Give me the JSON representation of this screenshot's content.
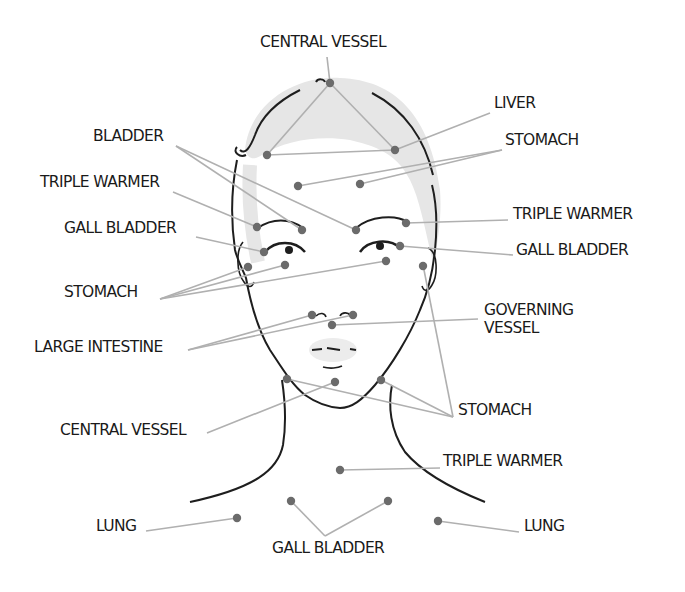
{
  "colors": {
    "point": "#6b6b6b",
    "leader": "#b0b0b0",
    "outline": "#1e1e1e",
    "hair": "#e3e3e3",
    "text": "#1a1a1a"
  },
  "labels": [
    {
      "id": "central-vessel-top",
      "text": "CENTRAL VESSEL",
      "x": 260,
      "y": 33
    },
    {
      "id": "liver",
      "text": "LIVER",
      "x": 494,
      "y": 94
    },
    {
      "id": "stomach-forehead",
      "text": "STOMACH",
      "x": 505,
      "y": 131
    },
    {
      "id": "bladder",
      "text": "BLADDER",
      "x": 93,
      "y": 127
    },
    {
      "id": "triple-warmer-left",
      "text": "TRIPLE WARMER",
      "x": 40,
      "y": 173
    },
    {
      "id": "gall-bladder-left",
      "text": "GALL BLADDER",
      "x": 64,
      "y": 219
    },
    {
      "id": "triple-warmer-right",
      "text": "TRIPLE WARMER",
      "x": 513,
      "y": 205
    },
    {
      "id": "gall-bladder-right",
      "text": "GALL BLADDER",
      "x": 516,
      "y": 241
    },
    {
      "id": "stomach-left",
      "text": "STOMACH",
      "x": 64,
      "y": 283
    },
    {
      "id": "governing-vessel",
      "text": "GOVERNING\nVESSEL",
      "x": 484,
      "y": 301
    },
    {
      "id": "large-intestine",
      "text": "LARGE INTESTINE",
      "x": 34,
      "y": 338
    },
    {
      "id": "stomach-jaw",
      "text": "STOMACH",
      "x": 458,
      "y": 401
    },
    {
      "id": "central-vessel-chin",
      "text": "CENTRAL VESSEL",
      "x": 60,
      "y": 421
    },
    {
      "id": "triple-warmer-neck",
      "text": "TRIPLE WARMER",
      "x": 443,
      "y": 452
    },
    {
      "id": "lung-left",
      "text": "LUNG",
      "x": 96,
      "y": 517
    },
    {
      "id": "lung-right",
      "text": "LUNG",
      "x": 524,
      "y": 517
    },
    {
      "id": "gall-bladder-bottom",
      "text": "GALL BLADDER",
      "x": 272,
      "y": 539
    }
  ],
  "points": [
    {
      "id": "p-crown",
      "x": 330,
      "y": 83
    },
    {
      "id": "p-hairline-left",
      "x": 267,
      "y": 155
    },
    {
      "id": "p-hairline-right",
      "x": 395,
      "y": 150
    },
    {
      "id": "p-forehead-left",
      "x": 298,
      "y": 186
    },
    {
      "id": "p-forehead-right",
      "x": 360,
      "y": 184
    },
    {
      "id": "p-brow-inner-left",
      "x": 302,
      "y": 230
    },
    {
      "id": "p-brow-inner-right",
      "x": 356,
      "y": 230
    },
    {
      "id": "p-brow-outer-left",
      "x": 257,
      "y": 227
    },
    {
      "id": "p-brow-outer-right",
      "x": 406,
      "y": 223
    },
    {
      "id": "p-eye-outer-left",
      "x": 264,
      "y": 252
    },
    {
      "id": "p-eye-outer-right",
      "x": 400,
      "y": 246
    },
    {
      "id": "p-temple-left",
      "x": 248,
      "y": 267
    },
    {
      "id": "p-under-eye-left",
      "x": 285,
      "y": 265
    },
    {
      "id": "p-under-eye-right",
      "x": 386,
      "y": 261
    },
    {
      "id": "p-temple-right",
      "x": 423,
      "y": 266
    },
    {
      "id": "p-nostril-left",
      "x": 312,
      "y": 315
    },
    {
      "id": "p-nostril-right",
      "x": 353,
      "y": 315
    },
    {
      "id": "p-philtrum",
      "x": 332,
      "y": 325
    },
    {
      "id": "p-mouth-corner-left",
      "x": 287,
      "y": 379
    },
    {
      "id": "p-chin",
      "x": 335,
      "y": 382
    },
    {
      "id": "p-mouth-corner-right",
      "x": 381,
      "y": 380
    },
    {
      "id": "p-throat",
      "x": 340,
      "y": 470
    },
    {
      "id": "p-collar-left",
      "x": 291,
      "y": 501
    },
    {
      "id": "p-collar-right",
      "x": 388,
      "y": 501
    },
    {
      "id": "p-lung-left",
      "x": 237,
      "y": 518
    },
    {
      "id": "p-lung-right",
      "x": 438,
      "y": 521
    }
  ],
  "leaders": [
    [
      327,
      57,
      330,
      83
    ],
    [
      330,
      83,
      267,
      155
    ],
    [
      330,
      83,
      395,
      150
    ],
    [
      490,
      113,
      395,
      150
    ],
    [
      267,
      155,
      395,
      150
    ],
    [
      502,
      150,
      298,
      186
    ],
    [
      502,
      150,
      360,
      184
    ],
    [
      176,
      146,
      302,
      230
    ],
    [
      176,
      146,
      356,
      230
    ],
    [
      173,
      192,
      257,
      227
    ],
    [
      406,
      223,
      508,
      220
    ],
    [
      196,
      237,
      264,
      252
    ],
    [
      400,
      246,
      513,
      255
    ],
    [
      160,
      299,
      248,
      267
    ],
    [
      160,
      299,
      285,
      265
    ],
    [
      160,
      299,
      386,
      261
    ],
    [
      188,
      350,
      312,
      315
    ],
    [
      188,
      350,
      353,
      315
    ],
    [
      332,
      325,
      478,
      319
    ],
    [
      424,
      270,
      453,
      417
    ],
    [
      287,
      379,
      453,
      417
    ],
    [
      381,
      380,
      453,
      417
    ],
    [
      207,
      433,
      335,
      382
    ],
    [
      340,
      470,
      440,
      468
    ],
    [
      146,
      531,
      237,
      518
    ],
    [
      291,
      501,
      325,
      536
    ],
    [
      388,
      501,
      325,
      536
    ],
    [
      438,
      521,
      519,
      532
    ]
  ]
}
